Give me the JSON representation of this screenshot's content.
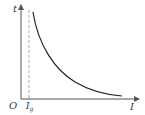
{
  "diagram": {
    "type": "function-graph",
    "axes": {
      "y_label": "t",
      "x_label": "I",
      "origin_label": "O"
    },
    "marker": {
      "label_main": "I",
      "label_sub": "g",
      "style": "dashed-vertical"
    },
    "curve": {
      "description": "decreasing hyperbola-like curve approaching x-axis",
      "color": "#222222"
    },
    "colors": {
      "axis": "#555555",
      "dashed": "#aaaaaa",
      "curve": "#222222"
    }
  }
}
